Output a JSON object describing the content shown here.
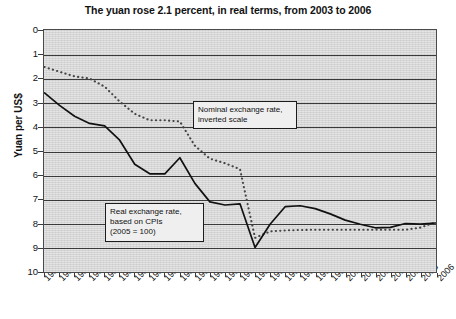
{
  "chart_data": {
    "type": "line",
    "title": "The yuan rose 2.1 percent, in real terms, from 2003 to 2006",
    "xlabel": "",
    "ylabel": "Yuan per US$",
    "ylim": [
      0,
      10
    ],
    "y_inverted": true,
    "grid": true,
    "legend_position": "annotations-inline",
    "x": [
      1980,
      1981,
      1982,
      1983,
      1984,
      1985,
      1986,
      1987,
      1988,
      1989,
      1990,
      1991,
      1992,
      1993,
      1994,
      1995,
      1996,
      1997,
      1998,
      1999,
      2000,
      2001,
      2002,
      2003,
      2004,
      2005,
      2006
    ],
    "yticks": [
      0,
      1,
      2,
      3,
      4,
      5,
      6,
      7,
      8,
      9,
      10
    ],
    "series": [
      {
        "name": "Nominal exchange rate, inverted scale",
        "style": "dotted",
        "values": [
          1.5,
          1.7,
          1.89,
          1.98,
          2.32,
          2.94,
          3.45,
          3.72,
          3.72,
          3.77,
          4.78,
          5.32,
          5.51,
          5.76,
          8.62,
          8.35,
          8.31,
          8.29,
          8.28,
          8.28,
          8.28,
          8.28,
          8.28,
          8.28,
          8.28,
          8.19,
          7.97
        ]
      },
      {
        "name": "Real exchange rate, based on CPIs (2005 = 100)",
        "style": "solid",
        "values": [
          2.58,
          3.1,
          3.55,
          3.85,
          3.95,
          4.55,
          5.55,
          5.95,
          5.95,
          5.28,
          6.35,
          7.12,
          7.25,
          7.2,
          9.02,
          8.05,
          7.32,
          7.28,
          7.4,
          7.62,
          7.88,
          8.05,
          8.2,
          8.18,
          8.02,
          8.05,
          8.0
        ]
      }
    ],
    "annotations": [
      {
        "id": "nominal",
        "lines": [
          "Nominal exchange rate,",
          "inverted scale"
        ]
      },
      {
        "id": "real",
        "lines": [
          "Real exchange rate,",
          "based on CPIs",
          "(2005 = 100)"
        ]
      }
    ]
  }
}
